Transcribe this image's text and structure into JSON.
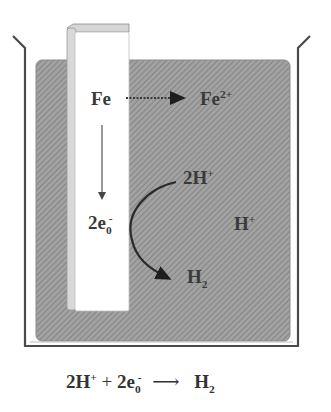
{
  "diagram": {
    "colors": {
      "solution_fill": "#9a9a9a",
      "solution_hatch": "#7a7a7a",
      "beaker_stroke": "#4a4a4a",
      "electrode_fill": "#ffffff",
      "electrode_edge": "#c8c8c8",
      "text": "#333333",
      "arrow": "#2a2a2a"
    },
    "components": {
      "beaker": "beaker",
      "solution": "acidic solution",
      "electrode": "iron electrode"
    },
    "labels": {
      "fe": "Fe",
      "fe2_base": "Fe",
      "fe2_sup": "2+",
      "electrons_base": "2e",
      "electrons_sub": "0",
      "electrons_sup": "-",
      "two_h_base": "2H",
      "two_h_sup": "+",
      "h_plus_base": "H",
      "h_plus_sup": "+",
      "h2_base": "H",
      "h2_sub": "2"
    },
    "equation": {
      "lhs_1_base": "2H",
      "lhs_1_sup": "+",
      "plus": "+",
      "lhs_2_base": "2e",
      "lhs_2_sub": "0",
      "lhs_2_sup": "-",
      "arrow": "⟶",
      "rhs_base": "H",
      "rhs_sub": "2"
    }
  }
}
